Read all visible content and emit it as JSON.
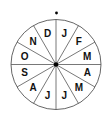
{
  "diagram": {
    "type": "month-wheel",
    "center": {
      "x": 56,
      "y": 64.5
    },
    "radius": 45,
    "marker_dot": {
      "x": 56.5,
      "y": 13
    },
    "segments": 12,
    "labels_clockwise_from_top": [
      "J",
      "F",
      "M",
      "A",
      "M",
      "J",
      "J",
      "A",
      "S",
      "O",
      "N",
      "D"
    ],
    "colors": {
      "stroke": "#555555",
      "text": "#111111",
      "dot": "#000000",
      "background": "#ffffff"
    }
  }
}
